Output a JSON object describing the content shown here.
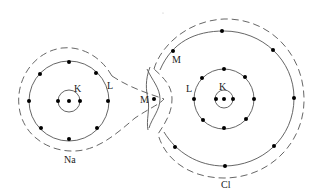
{
  "diagram": {
    "colors": {
      "line": "#555555",
      "electron": "#000000",
      "background": "#ffffff"
    },
    "atoms": [
      {
        "id": "na",
        "label": "Na",
        "shells": [
          {
            "name": "K",
            "label": "K",
            "electrons": 2
          },
          {
            "name": "L",
            "label": "L",
            "electrons": 8
          },
          {
            "name": "M",
            "label": "M",
            "electrons": 1
          }
        ]
      },
      {
        "id": "cl",
        "label": "Cl",
        "shells": [
          {
            "name": "K",
            "label": "K",
            "electrons": 2
          },
          {
            "name": "L",
            "label": "L",
            "electrons": 8
          },
          {
            "name": "M",
            "label": "M",
            "electrons": 7
          }
        ]
      }
    ]
  },
  "labels": {
    "na_atom": "Na",
    "na_k": "K",
    "na_l": "L",
    "na_m": "M",
    "cl_atom": "Cl",
    "cl_k": "K",
    "cl_l": "L",
    "cl_m": "M"
  }
}
